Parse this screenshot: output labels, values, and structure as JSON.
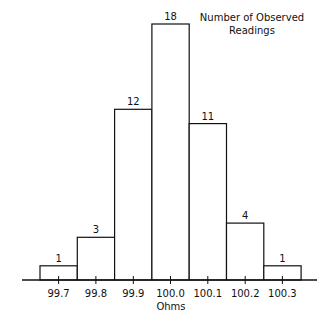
{
  "chart_data": {
    "type": "bar",
    "subtype": "histogram",
    "title": "Number of Observed Readings",
    "title_lines": [
      "Number of Observed",
      "Readings"
    ],
    "xlabel": "Ohms",
    "ylabel": "",
    "categories": [
      "99.7",
      "99.8",
      "99.9",
      "100.0",
      "100.1",
      "100.2",
      "100.3"
    ],
    "values": [
      1,
      3,
      12,
      18,
      11,
      4,
      1
    ],
    "data_labels": [
      "1",
      "3",
      "12",
      "18",
      "11",
      "4",
      "1"
    ],
    "ylim": [
      0,
      18
    ],
    "grid": false,
    "legend": "none",
    "y_axis_visible": false
  }
}
